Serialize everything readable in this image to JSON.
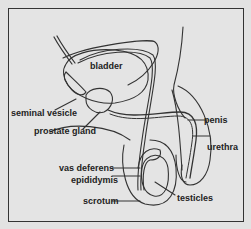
{
  "diagram": {
    "type": "anatomical-illustration",
    "labels": {
      "bladder": "bladder",
      "seminal_vesicle": "seminal vesicle",
      "prostate_gland": "prostate gland",
      "penis": "penis",
      "urethra": "urethra",
      "vas_deferens": "vas deferens",
      "epididymis": "epididymis",
      "scrotum": "scrotum",
      "testicles": "testicles"
    },
    "colors": {
      "background": "#e2e2e2",
      "line": "#333333",
      "text": "#222222"
    }
  }
}
